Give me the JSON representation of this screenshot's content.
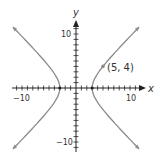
{
  "chart_data": {
    "type": "line",
    "title": "",
    "equation": "x^2/9 - y^2/9 = 1",
    "xlabel": "x",
    "ylabel": "y",
    "xlim": [
      -12,
      12
    ],
    "ylim": [
      -12,
      12
    ],
    "grid": false,
    "tick_step": 1,
    "x_tick_labels": [
      {
        "value": -10,
        "label": "−10"
      },
      {
        "value": 10,
        "label": "10"
      }
    ],
    "y_tick_labels": [
      {
        "value": 10,
        "label": "10"
      },
      {
        "value": -10,
        "label": "−10"
      }
    ],
    "series": [
      {
        "name": "right branch",
        "vertex": [
          3,
          0
        ],
        "y_range": [
          -11.3,
          11.3
        ],
        "arrows": true
      },
      {
        "name": "left branch",
        "vertex": [
          -3,
          0
        ],
        "y_range": [
          -11.3,
          11.3
        ],
        "arrows": true
      }
    ],
    "points": [
      {
        "x": 3,
        "y": 0,
        "label": ""
      },
      {
        "x": -3,
        "y": 0,
        "label": ""
      },
      {
        "x": 5,
        "y": 4,
        "label": "(5, 4)"
      }
    ],
    "annotations": [
      {
        "text": "(5, 4)",
        "at": [
          5,
          4
        ]
      }
    ],
    "colors": {
      "curve": "#8a8a8a",
      "axis": "#222222",
      "text": "#333333"
    }
  },
  "labels": {
    "x_axis": "x",
    "y_axis": "y",
    "x_neg10": "−10",
    "x_pos10": "10",
    "y_pos10": "10",
    "y_neg10": "−10",
    "point": "(5, 4)"
  }
}
